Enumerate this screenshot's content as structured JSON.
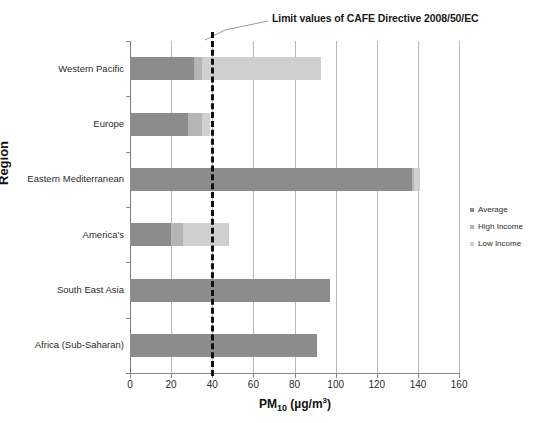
{
  "chart_data": {
    "type": "bar",
    "orientation": "horizontal",
    "stacked": true,
    "title": "",
    "annotation": "Limit values of CAFE Directive 2008/50/EC",
    "xlabel_html": "PM10 (µg/m³)",
    "xlabel_main": "PM",
    "xlabel_sub": "10",
    "xlabel_units_open": " (µg/m",
    "xlabel_units_sup": "3",
    "xlabel_units_close": ")",
    "ylabel": "Region",
    "categories": [
      "Western Pacific",
      "Europe",
      "Eastern Mediterranean",
      "America's",
      "South East Asia",
      "Africa (Sub-Saharan)"
    ],
    "series": [
      {
        "name": "Average",
        "color": "#8c8c8c",
        "values": [
          31,
          28,
          137,
          20,
          97,
          91
        ]
      },
      {
        "name": "High Income",
        "color": "#b5b5b5",
        "values": [
          35,
          35,
          138,
          26,
          97,
          91
        ]
      },
      {
        "name": "Low Income",
        "color": "#cfcfcf",
        "values": [
          93,
          39,
          141,
          48,
          97,
          91
        ]
      }
    ],
    "xlim": [
      0,
      160
    ],
    "xticks": [
      0,
      20,
      40,
      60,
      80,
      100,
      120,
      140,
      160
    ],
    "xtick_labels": [
      "0",
      "20",
      "40",
      "60",
      "80",
      "100",
      "120",
      "140",
      "160"
    ],
    "grid": true,
    "grid_axis": "x",
    "legend_position": "right",
    "reference_line": {
      "name": "CAFE limit",
      "value": 40,
      "style": "dashed",
      "color": "#111111",
      "label": "Limit values of CAFE Directive 2008/50/EC"
    }
  }
}
